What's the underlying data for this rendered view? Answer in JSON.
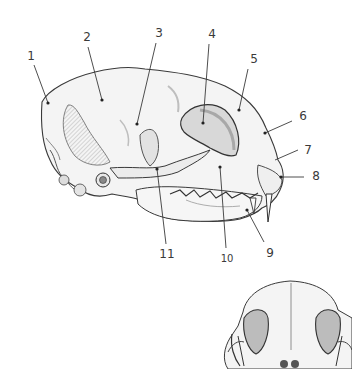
{
  "figure": {
    "views": [
      "lateral view",
      "frontal view (partial)"
    ],
    "ink_color": "#3a3a3a",
    "shade_color": "#bdbdbd",
    "bone_color": "#f2f2f2"
  },
  "labels": [
    {
      "id": "1",
      "text": "1",
      "x": 31,
      "y": 56,
      "target_x": 48,
      "target_y": 103
    },
    {
      "id": "2",
      "text": "2",
      "x": 87,
      "y": 37,
      "target_x": 102,
      "target_y": 100
    },
    {
      "id": "3",
      "text": "3",
      "x": 159,
      "y": 33,
      "target_x": 137,
      "target_y": 124
    },
    {
      "id": "4",
      "text": "4",
      "x": 212,
      "y": 34,
      "target_x": 203,
      "target_y": 123
    },
    {
      "id": "5",
      "text": "5",
      "x": 254,
      "y": 59,
      "target_x": 239,
      "target_y": 110
    },
    {
      "id": "6",
      "text": "6",
      "x": 303,
      "y": 116,
      "target_x": 265,
      "target_y": 133
    },
    {
      "id": "7",
      "text": "7",
      "x": 308,
      "y": 150,
      "target_x": 275,
      "target_y": 160
    },
    {
      "id": "8",
      "text": "8",
      "x": 316,
      "y": 176,
      "target_x": 281,
      "target_y": 177
    },
    {
      "id": "9",
      "text": "9",
      "x": 270,
      "y": 253,
      "target_x": 247,
      "target_y": 210
    },
    {
      "id": "10",
      "text": "10",
      "x": 227,
      "y": 259,
      "target_x": 220,
      "target_y": 167
    },
    {
      "id": "11",
      "text": "11",
      "x": 167,
      "y": 254,
      "target_x": 157,
      "target_y": 169
    }
  ]
}
